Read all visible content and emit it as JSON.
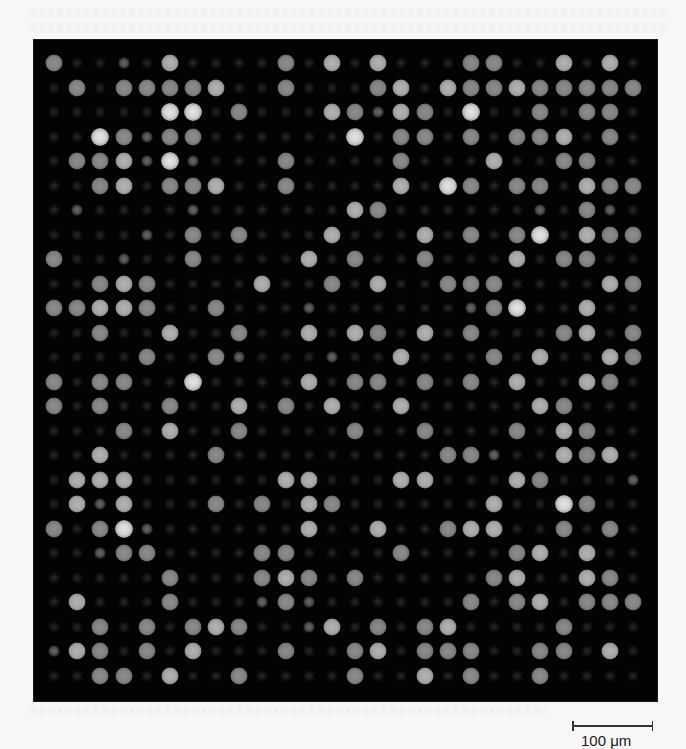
{
  "figure": {
    "background_color": "#f7f7f7",
    "panel_color": "#030303"
  },
  "scale_bar": {
    "label": "100 μm",
    "value": 100,
    "unit": "μm",
    "length_px": 81
  },
  "chart_data": {
    "type": "heatmap",
    "title": "",
    "xlabel": "",
    "ylabel": "",
    "rows": 26,
    "cols": 26,
    "intensity_scale": {
      "0": "faint / background",
      "1": "dim",
      "2": "medium",
      "3": "bright",
      "4": "very bright"
    },
    "grid": {
      "first_x": 20,
      "first_y": 23,
      "pitch_x": 23.16,
      "pitch_y": 24.5
    },
    "intensity_matrix": [
      [
        2,
        0,
        0,
        1,
        0,
        3,
        0,
        0,
        0,
        0,
        2,
        0,
        3,
        0,
        3,
        0,
        0,
        0,
        2,
        2,
        0,
        0,
        3,
        0,
        3,
        0
      ],
      [
        0,
        2,
        0,
        2,
        2,
        2,
        2,
        3,
        0,
        0,
        2,
        0,
        0,
        0,
        2,
        3,
        0,
        3,
        2,
        2,
        3,
        2,
        2,
        2,
        2,
        2
      ],
      [
        0,
        0,
        0,
        0,
        0,
        4,
        4,
        0,
        2,
        0,
        0,
        0,
        3,
        2,
        1,
        3,
        2,
        0,
        4,
        0,
        0,
        2,
        0,
        2,
        2,
        0
      ],
      [
        0,
        0,
        4,
        2,
        1,
        2,
        2,
        0,
        0,
        0,
        0,
        0,
        0,
        4,
        0,
        2,
        2,
        0,
        2,
        0,
        2,
        2,
        3,
        0,
        2,
        0
      ],
      [
        0,
        2,
        2,
        3,
        1,
        4,
        1,
        0,
        0,
        0,
        2,
        0,
        0,
        0,
        0,
        2,
        0,
        0,
        0,
        3,
        0,
        0,
        2,
        2,
        0,
        0
      ],
      [
        0,
        0,
        2,
        3,
        0,
        2,
        2,
        3,
        0,
        0,
        2,
        0,
        0,
        0,
        0,
        3,
        0,
        4,
        2,
        0,
        2,
        2,
        0,
        3,
        2,
        2
      ],
      [
        0,
        1,
        0,
        0,
        0,
        0,
        1,
        0,
        0,
        0,
        0,
        0,
        0,
        3,
        2,
        0,
        0,
        0,
        0,
        0,
        0,
        1,
        0,
        2,
        1,
        0
      ],
      [
        0,
        0,
        0,
        0,
        1,
        0,
        2,
        0,
        2,
        0,
        0,
        0,
        3,
        0,
        0,
        0,
        3,
        0,
        2,
        0,
        2,
        4,
        0,
        3,
        2,
        2
      ],
      [
        2,
        0,
        0,
        1,
        0,
        0,
        2,
        0,
        0,
        0,
        0,
        3,
        0,
        2,
        0,
        0,
        2,
        0,
        0,
        0,
        3,
        0,
        2,
        2,
        0,
        0
      ],
      [
        0,
        0,
        2,
        3,
        2,
        0,
        0,
        0,
        0,
        3,
        0,
        0,
        2,
        0,
        3,
        0,
        0,
        2,
        2,
        2,
        0,
        0,
        0,
        0,
        3,
        2
      ],
      [
        2,
        2,
        3,
        3,
        2,
        0,
        0,
        2,
        0,
        0,
        0,
        1,
        0,
        0,
        0,
        0,
        0,
        0,
        1,
        2,
        4,
        0,
        0,
        3,
        0,
        0
      ],
      [
        0,
        0,
        2,
        0,
        0,
        3,
        0,
        0,
        2,
        0,
        0,
        3,
        0,
        3,
        2,
        0,
        3,
        0,
        2,
        0,
        0,
        0,
        2,
        3,
        0,
        2
      ],
      [
        0,
        0,
        0,
        0,
        2,
        0,
        0,
        2,
        1,
        0,
        0,
        0,
        1,
        0,
        0,
        3,
        0,
        0,
        0,
        2,
        0,
        3,
        0,
        0,
        3,
        2
      ],
      [
        2,
        0,
        2,
        2,
        0,
        0,
        4,
        0,
        0,
        0,
        0,
        3,
        0,
        2,
        2,
        0,
        2,
        0,
        2,
        0,
        3,
        0,
        0,
        3,
        2,
        0
      ],
      [
        2,
        0,
        2,
        0,
        0,
        2,
        0,
        0,
        3,
        0,
        2,
        0,
        3,
        0,
        0,
        3,
        0,
        0,
        0,
        0,
        0,
        3,
        2,
        0,
        0,
        0
      ],
      [
        0,
        0,
        0,
        2,
        0,
        3,
        0,
        0,
        2,
        0,
        0,
        0,
        0,
        2,
        0,
        0,
        2,
        0,
        0,
        0,
        2,
        0,
        3,
        2,
        0,
        0
      ],
      [
        0,
        0,
        3,
        0,
        0,
        0,
        0,
        2,
        0,
        0,
        0,
        0,
        0,
        0,
        0,
        0,
        0,
        2,
        2,
        1,
        0,
        0,
        3,
        2,
        3,
        0
      ],
      [
        0,
        3,
        3,
        3,
        0,
        0,
        0,
        0,
        0,
        0,
        3,
        3,
        0,
        0,
        0,
        3,
        3,
        0,
        0,
        0,
        3,
        2,
        0,
        0,
        0,
        1
      ],
      [
        0,
        3,
        1,
        3,
        0,
        0,
        0,
        2,
        0,
        2,
        0,
        3,
        2,
        0,
        0,
        0,
        0,
        0,
        0,
        3,
        0,
        0,
        4,
        2,
        0,
        0
      ],
      [
        2,
        0,
        2,
        4,
        1,
        0,
        0,
        0,
        0,
        0,
        0,
        3,
        0,
        0,
        3,
        0,
        0,
        2,
        3,
        3,
        0,
        0,
        2,
        0,
        2,
        0
      ],
      [
        0,
        0,
        1,
        2,
        2,
        0,
        0,
        0,
        0,
        2,
        2,
        0,
        0,
        0,
        0,
        2,
        0,
        0,
        0,
        0,
        2,
        3,
        0,
        3,
        0,
        0
      ],
      [
        0,
        0,
        0,
        0,
        0,
        2,
        0,
        0,
        0,
        2,
        3,
        2,
        0,
        2,
        0,
        0,
        0,
        0,
        0,
        2,
        3,
        0,
        0,
        3,
        2,
        0
      ],
      [
        0,
        3,
        0,
        0,
        0,
        2,
        0,
        0,
        0,
        1,
        2,
        1,
        0,
        0,
        0,
        0,
        0,
        0,
        2,
        0,
        2,
        3,
        0,
        2,
        2,
        2
      ],
      [
        0,
        0,
        2,
        0,
        2,
        0,
        2,
        3,
        2,
        0,
        0,
        1,
        3,
        0,
        2,
        0,
        2,
        3,
        0,
        0,
        0,
        0,
        2,
        0,
        0,
        0
      ],
      [
        1,
        3,
        2,
        0,
        2,
        0,
        3,
        0,
        0,
        0,
        2,
        0,
        0,
        2,
        3,
        0,
        2,
        2,
        2,
        0,
        0,
        2,
        2,
        0,
        3,
        0
      ],
      [
        0,
        0,
        2,
        2,
        0,
        3,
        0,
        0,
        2,
        0,
        0,
        0,
        0,
        2,
        0,
        0,
        3,
        0,
        2,
        0,
        0,
        2,
        0,
        0,
        0,
        0
      ]
    ]
  }
}
